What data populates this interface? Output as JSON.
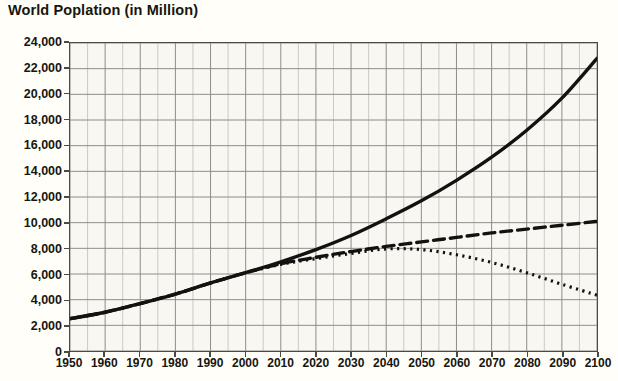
{
  "chart_data": {
    "type": "line",
    "title": "World Poplation (in Million)",
    "xlabel": "",
    "ylabel": "",
    "xlim": [
      1950,
      2100
    ],
    "ylim": [
      0,
      24000
    ],
    "ytick_step": 2000,
    "xtick_step": 10,
    "grid": true,
    "minor_grid_x_step": 5,
    "legend": "none",
    "x": [
      1950,
      1960,
      1970,
      1980,
      1990,
      2000,
      2010,
      2020,
      2030,
      2040,
      2050,
      2060,
      2070,
      2080,
      2090,
      2100
    ],
    "xtick_labels": [
      "1950",
      "1960",
      "1970",
      "1980",
      "1990",
      "2000",
      "2010",
      "2020",
      "2030",
      "2040",
      "2050",
      "2060",
      "2070",
      "2080",
      "2090",
      "2100"
    ],
    "ytick_labels": [
      "0",
      "2,000",
      "4,000",
      "6,000",
      "8,000",
      "10,000",
      "12,000",
      "14,000",
      "16,000",
      "18,000",
      "20,000",
      "22,000",
      "24,000"
    ],
    "series": [
      {
        "name": "High variant",
        "style": "solid",
        "color": "#121210",
        "values": [
          2520,
          3020,
          3700,
          4440,
          5300,
          6100,
          6950,
          7900,
          9000,
          10300,
          11700,
          13300,
          15100,
          17200,
          19700,
          22800
        ]
      },
      {
        "name": "Medium variant",
        "style": "dashed",
        "color": "#121210",
        "values": [
          2520,
          3020,
          3700,
          4440,
          5300,
          6100,
          6800,
          7300,
          7750,
          8150,
          8500,
          8850,
          9200,
          9500,
          9800,
          10100
        ]
      },
      {
        "name": "Low variant",
        "style": "dotted",
        "color": "#121210",
        "values": [
          2520,
          3020,
          3700,
          4440,
          5300,
          6100,
          6750,
          7200,
          7600,
          7950,
          7900,
          7500,
          6900,
          6100,
          5200,
          4350
        ]
      }
    ]
  }
}
